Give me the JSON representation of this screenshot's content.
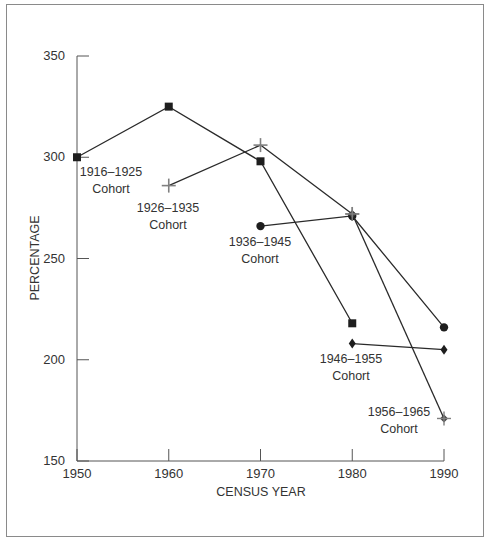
{
  "chart_data": {
    "type": "line",
    "title": "",
    "xlabel": "CENSUS YEAR",
    "ylabel": "PERCENTAGE",
    "x": [
      1950,
      1960,
      1970,
      1980,
      1990
    ],
    "xticks": [
      "1950",
      "1960",
      "1970",
      "1980",
      "1990"
    ],
    "yticks": [
      "150",
      "200",
      "250",
      "300",
      "350"
    ],
    "ylim": [
      150,
      350
    ],
    "xlim": [
      1950,
      1990
    ],
    "grid": false,
    "legend": "inline labels",
    "series": [
      {
        "name": "1916–1925 Cohort",
        "marker": "square",
        "points": [
          [
            1950,
            300
          ],
          [
            1960,
            325
          ],
          [
            1970,
            298
          ],
          [
            1980,
            218
          ]
        ]
      },
      {
        "name": "1926–1935 Cohort",
        "marker": "plus",
        "points": [
          [
            1960,
            286
          ],
          [
            1970,
            306
          ],
          [
            1980,
            272
          ]
        ]
      },
      {
        "name": "1936–1945 Cohort",
        "marker": "circle",
        "points": [
          [
            1970,
            266
          ],
          [
            1980,
            271
          ],
          [
            1990,
            216
          ]
        ]
      },
      {
        "name": "1946–1955 Cohort",
        "marker": "diamond",
        "points": [
          [
            1980,
            208
          ],
          [
            1990,
            205
          ]
        ]
      },
      {
        "name": "1956–1965 Cohort",
        "marker": "diamond-plus",
        "points": [
          [
            1980,
            272
          ],
          [
            1990,
            171
          ]
        ]
      }
    ]
  },
  "labels": {
    "c1_line1": "1916–1925",
    "c1_line2": "Cohort",
    "c2_line1": "1926–1935",
    "c2_line2": "Cohort",
    "c3_line1": "1936–1945",
    "c3_line2": "Cohort",
    "c4_line1": "1946–1955",
    "c4_line2": "Cohort",
    "c5_line1": "1956–1965",
    "c5_line2": "Cohort"
  },
  "colors": {
    "line": "#2a2a2a",
    "marker": "#1e1e1e",
    "plus_marker": "#808080",
    "frame": "#8a8a8a"
  }
}
